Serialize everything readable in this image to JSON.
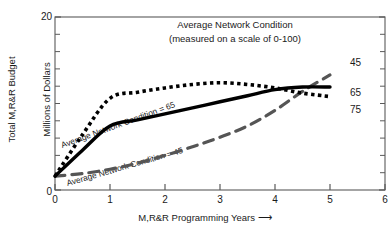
{
  "chart_data": {
    "type": "line",
    "title": "Average Network Condition\n(measured on a scale of 0-100)",
    "title_line1": "Average Network Condition",
    "title_line2": "(measured on a scale of 0-100)",
    "xlabel": "M,R&R Programming Years",
    "xlabel_arrow": "⟶",
    "ylabel": "Total M,R&R Budget\nMillions of Dollars",
    "ylabel_line1": "Total M,R&R Budget",
    "ylabel_line2": "Millions of Dollars",
    "xlim": [
      0,
      6
    ],
    "ylim": [
      0,
      20
    ],
    "x_ticks": [
      "0",
      "1",
      "2",
      "3",
      "4",
      "5",
      "6"
    ],
    "x_tick_values": [
      0,
      1,
      2,
      3,
      4,
      5,
      6
    ],
    "x_minor_ticks": false,
    "y_ticks": [
      "0",
      "20"
    ],
    "y_tick_values": [
      0,
      20
    ],
    "y_minor_tick_values": [
      2,
      4,
      6,
      8,
      10,
      12,
      14,
      16,
      18
    ],
    "grid": false,
    "legend_position": "right-of-axes",
    "series": [
      {
        "name": "45",
        "label": "45",
        "annotation": "Average Network Condition = 45",
        "style": "long-dashed",
        "color": "#555555",
        "x": [
          0,
          0.5,
          1,
          1.5,
          2,
          2.5,
          3,
          3.5,
          4,
          4.5,
          5
        ],
        "values": [
          1.6,
          1.9,
          2.4,
          3.1,
          4.0,
          5.0,
          6.1,
          7.4,
          9.2,
          11.4,
          13.3
        ]
      },
      {
        "name": "65",
        "label": "65",
        "annotation": "Average Network Condition = 65",
        "style": "solid",
        "color": "#000000",
        "x": [
          0,
          0.5,
          1,
          1.5,
          2,
          2.5,
          3,
          3.5,
          4,
          4.5,
          5
        ],
        "values": [
          1.6,
          4.6,
          7.4,
          8.1,
          8.8,
          9.5,
          10.2,
          10.9,
          11.6,
          11.9,
          11.9
        ]
      },
      {
        "name": "75",
        "label": "75",
        "annotation": "",
        "style": "dotted",
        "color": "#000000",
        "x": [
          0,
          0.5,
          1,
          1.5,
          2,
          2.5,
          3,
          3.5,
          4,
          4.5,
          5
        ],
        "values": [
          1.6,
          6.4,
          10.6,
          11.3,
          11.8,
          12.2,
          12.4,
          12.2,
          11.8,
          11.2,
          10.8
        ]
      }
    ]
  },
  "axes": {
    "x_axis_name": "M,R&R Programming Years axis",
    "y_axis_name": "Total M,R&R Budget axis"
  }
}
